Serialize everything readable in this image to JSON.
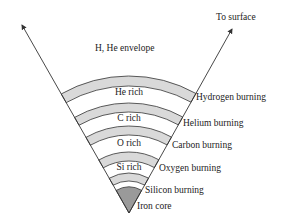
{
  "diagram": {
    "title_arrow_label": "To surface",
    "envelope_label": "H, He envelope",
    "shells": [
      {
        "name": "He rich",
        "burning": "Hydrogen burning"
      },
      {
        "name": "C rich",
        "burning": "Helium burning"
      },
      {
        "name": "O rich",
        "burning": "Carbon burning"
      },
      {
        "name": "Si rich",
        "burning": "Oxygen burning"
      },
      {
        "name": "",
        "burning": "Silicon burning"
      }
    ],
    "core_label": "Iron core",
    "colors": {
      "band_fill": "#d9d9d9",
      "core_fill": "#9a9a9a",
      "line": "#333333"
    }
  }
}
